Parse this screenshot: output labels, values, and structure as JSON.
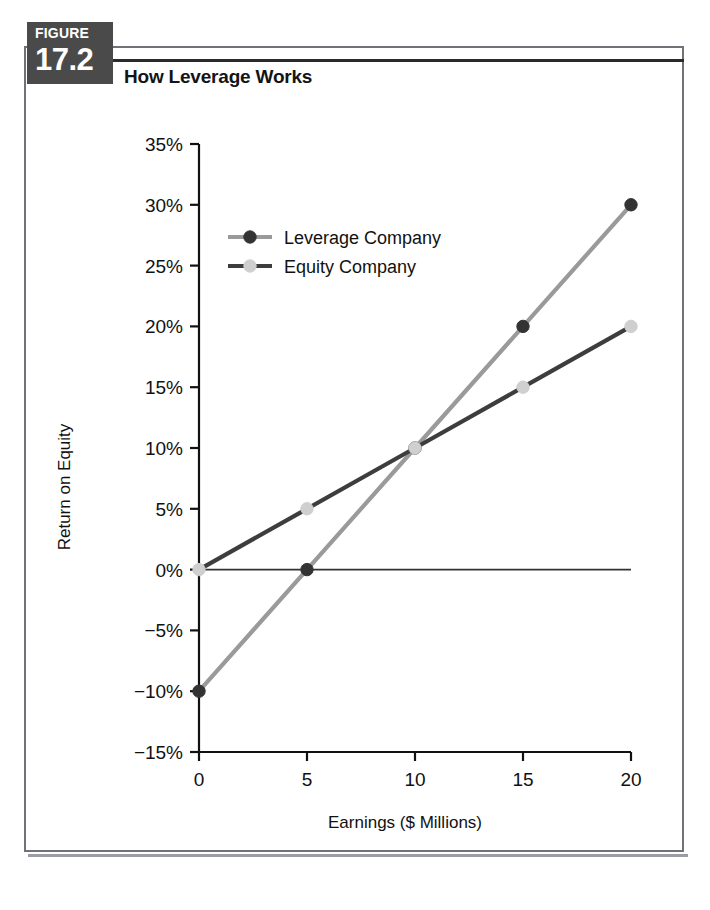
{
  "figure": {
    "badge_word": "FIGURE",
    "badge_number": "17.2",
    "title": "How Leverage Works"
  },
  "colors": {
    "badge_background": "#4a4a4a",
    "frame_border": "#6f7276",
    "axis": "#111111",
    "leverage_line": "#9a9a9a",
    "leverage_marker": "#333333",
    "equity_line": "#3d3d3d",
    "equity_marker": "#cfcfcf",
    "zero_line": "#333333"
  },
  "chart_data": {
    "type": "line",
    "title": "How Leverage Works",
    "xlabel": "Earnings ($ Millions)",
    "ylabel": "Return on Equity",
    "x": [
      0,
      5,
      10,
      15,
      20
    ],
    "xticklabels": [
      "0",
      "5",
      "10",
      "15",
      "20"
    ],
    "xlim": [
      0,
      20
    ],
    "ylim": [
      -15,
      35
    ],
    "yticks": [
      35,
      30,
      25,
      20,
      15,
      10,
      5,
      0,
      -5,
      -10,
      -15
    ],
    "yticklabels": [
      "35%",
      "30%",
      "25%",
      "20%",
      "15%",
      "10%",
      "5%",
      "0%",
      "−5%",
      "−10%",
      "−15%"
    ],
    "grid": false,
    "legend_position": "upper left inside",
    "zero_line": true,
    "series": [
      {
        "name": "Leverage Company",
        "values": [
          -10,
          0,
          10,
          20,
          30
        ],
        "line_color": "#9a9a9a",
        "marker_color": "#333333"
      },
      {
        "name": "Equity Company",
        "values": [
          0,
          5,
          10,
          15,
          20
        ],
        "line_color": "#3d3d3d",
        "marker_color": "#cfcfcf"
      }
    ]
  }
}
